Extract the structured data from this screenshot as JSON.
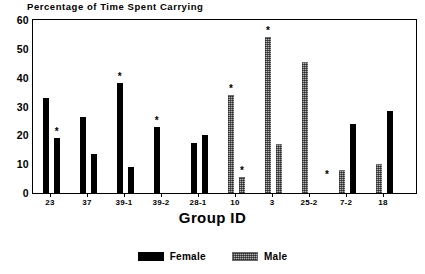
{
  "chart_data": {
    "type": "bar",
    "title": "Percentage of Time Spent Carrying",
    "xlabel": "Group ID",
    "ylabel": "",
    "ylim": [
      0,
      60
    ],
    "yticks": [
      0,
      10,
      20,
      30,
      40,
      50,
      60
    ],
    "grid": false,
    "legend_position": "bottom-center",
    "categories": [
      "23",
      "37",
      "39-1",
      "39-2",
      "28-1",
      "10",
      "3",
      "25-2",
      "7-2",
      "18"
    ],
    "series": [
      {
        "name": "Female",
        "color": "#000000",
        "values": [
          33,
          26.5,
          38,
          23,
          17.5,
          0,
          0,
          0,
          24,
          28.5
        ]
      },
      {
        "name": "Male",
        "color": "#b4b4b4",
        "values": [
          19,
          13.5,
          9,
          0,
          20,
          34,
          54,
          45.5,
          8,
          10
        ]
      }
    ],
    "extra_bars": [
      {
        "category": "10",
        "series": "Male",
        "value": 5.5
      },
      {
        "category": "3",
        "series": "Male",
        "value": 17
      }
    ],
    "annotations": [
      {
        "label": "*",
        "category": "23",
        "series": "Male",
        "value": 19
      },
      {
        "label": "*",
        "category": "39-1",
        "series": "Female",
        "value": 38
      },
      {
        "label": "*",
        "category": "39-2",
        "series": "Female",
        "value": 23
      },
      {
        "label": "*",
        "category": "10",
        "series": "Male",
        "value": 34
      },
      {
        "label": "*",
        "category": "10",
        "series": "Male2",
        "value": 5.5
      },
      {
        "label": "*",
        "category": "3",
        "series": "Male",
        "value": 54
      },
      {
        "label": "*",
        "category": "7-2",
        "series": "Female",
        "value": 4
      }
    ],
    "bars_layout": [
      {
        "x": 10,
        "w": 5.5,
        "h": 33,
        "fill": "female",
        "star": null
      },
      {
        "x": 21,
        "w": 5.5,
        "h": 19,
        "fill": "female",
        "star": 19
      },
      {
        "x": 47,
        "w": 5.5,
        "h": 26.5,
        "fill": "female",
        "star": null
      },
      {
        "x": 58,
        "w": 5.5,
        "h": 13.5,
        "fill": "female",
        "star": null
      },
      {
        "x": 84,
        "w": 5.5,
        "h": 38,
        "fill": "female",
        "star": 38
      },
      {
        "x": 95,
        "w": 5.5,
        "h": 9,
        "fill": "female",
        "star": null
      },
      {
        "x": 121,
        "w": 5.5,
        "h": 23,
        "fill": "female",
        "star": 23
      },
      {
        "x": 158,
        "w": 5.5,
        "h": 17.5,
        "fill": "female",
        "star": null
      },
      {
        "x": 169,
        "w": 5.5,
        "h": 20,
        "fill": "female",
        "star": null
      },
      {
        "x": 195,
        "w": 6,
        "h": 34,
        "fill": "male",
        "star": 34
      },
      {
        "x": 206,
        "w": 6,
        "h": 5.5,
        "fill": "male",
        "star": 5.5
      },
      {
        "x": 232,
        "w": 6,
        "h": 54,
        "fill": "male",
        "star": 54
      },
      {
        "x": 243,
        "w": 6,
        "h": 17,
        "fill": "male",
        "star": null
      },
      {
        "x": 269,
        "w": 6,
        "h": 45.5,
        "fill": "male",
        "star": null
      },
      {
        "x": 291,
        "w": 0,
        "h": 0,
        "fill": "female",
        "star": 4
      },
      {
        "x": 306,
        "w": 6,
        "h": 8,
        "fill": "male",
        "star": null
      },
      {
        "x": 317,
        "w": 5.5,
        "h": 24,
        "fill": "female",
        "star": null
      },
      {
        "x": 343,
        "w": 6,
        "h": 10,
        "fill": "male",
        "star": null
      },
      {
        "x": 354,
        "w": 5.5,
        "h": 28.5,
        "fill": "female",
        "star": null
      }
    ],
    "xtick_positions": [
      17,
      54,
      91,
      128,
      165,
      202,
      239,
      276,
      313,
      350
    ],
    "legend_entries": [
      {
        "label": "Female",
        "fill": "female"
      },
      {
        "label": "Male",
        "fill": "male"
      }
    ]
  }
}
